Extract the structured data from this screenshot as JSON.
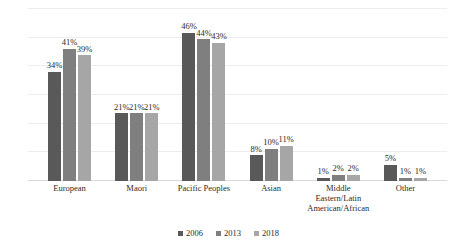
{
  "chart_data": {
    "type": "bar",
    "title": "",
    "subtitle": "",
    "xlabel": "",
    "ylabel": "",
    "ylim": [
      0,
      50
    ],
    "grid": true,
    "legend_position": "bottom",
    "value_suffix": "%",
    "categories": [
      "European",
      "Maori",
      "Pacific Peoples",
      "Asian",
      "Middle Eastern/Latin American/African",
      "Other"
    ],
    "category_lines": [
      [
        "European"
      ],
      [
        "Maori"
      ],
      [
        "Pacific Peoples"
      ],
      [
        "Asian"
      ],
      [
        "Middle",
        "Eastern/Latin",
        "American/African"
      ],
      [
        "Other"
      ]
    ],
    "series": [
      {
        "name": "2006",
        "color": "#595959",
        "values": [
          34,
          21,
          46,
          8,
          1,
          5
        ],
        "labels": [
          "34%",
          "21%",
          "46%",
          "8%",
          "1%",
          "5%"
        ]
      },
      {
        "name": "2013",
        "color": "#7f7f7f",
        "values": [
          41,
          21,
          44,
          10,
          2,
          1
        ],
        "labels": [
          "41%",
          "21%",
          "44%",
          "10%",
          "2%",
          "1%"
        ]
      },
      {
        "name": "2018",
        "color": "#a6a6a6",
        "values": [
          39,
          21,
          43,
          11,
          2,
          1
        ],
        "labels": [
          "39%",
          "21%",
          "43%",
          "11%",
          "2%",
          "1%"
        ]
      }
    ],
    "gridline_count": 6
  }
}
